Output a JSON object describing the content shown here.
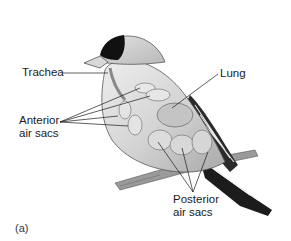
{
  "figure": {
    "panel_label": "(a)",
    "labels": {
      "trachea": "Trachea",
      "lung": "Lung",
      "anterior_line1": "Anterior",
      "anterior_line2": "air sacs",
      "posterior_line1": "Posterior",
      "posterior_line2": "air sacs"
    }
  },
  "colors": {
    "background": "#ffffff",
    "ink": "#1a1a1a",
    "body": "#d4d4d4",
    "cap": "#111111",
    "air_sac": "#e6e6e6",
    "lung": "#c4c4c4"
  }
}
